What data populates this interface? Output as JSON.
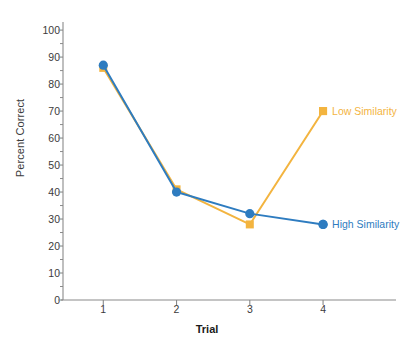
{
  "chart_data": {
    "type": "line",
    "title": "",
    "xlabel": "Trial",
    "ylabel": "Percent Correct",
    "x": [
      1,
      2,
      3,
      4
    ],
    "categories": [
      "1",
      "2",
      "3",
      "4"
    ],
    "xtick_labels": [
      "1",
      "2",
      "3",
      "4"
    ],
    "ytick_labels": [
      "0",
      "10",
      "20",
      "30",
      "40",
      "50",
      "60",
      "70",
      "80",
      "90",
      "100"
    ],
    "ytick_values": [
      0,
      10,
      20,
      30,
      40,
      50,
      60,
      70,
      80,
      90,
      100
    ],
    "yminor_values": [
      5,
      15,
      25,
      35,
      45,
      55,
      65,
      75,
      85,
      95
    ],
    "xlim": [
      0.45,
      4.75
    ],
    "ylim": [
      0,
      103
    ],
    "grid": false,
    "legend_position": "inline-right",
    "series": [
      {
        "name": "Low Similarity",
        "color": "#F3B43F",
        "marker": "square",
        "values": [
          86,
          41,
          28,
          70
        ],
        "label_x": 4,
        "label_y": 70
      },
      {
        "name": "High Similarity",
        "color": "#2E7CC0",
        "marker": "circle",
        "values": [
          87,
          40,
          32,
          28
        ],
        "label_x": 4,
        "label_y": 28
      }
    ],
    "axis_color": "#8a8a8a",
    "text_color": "#3b3b3b"
  }
}
